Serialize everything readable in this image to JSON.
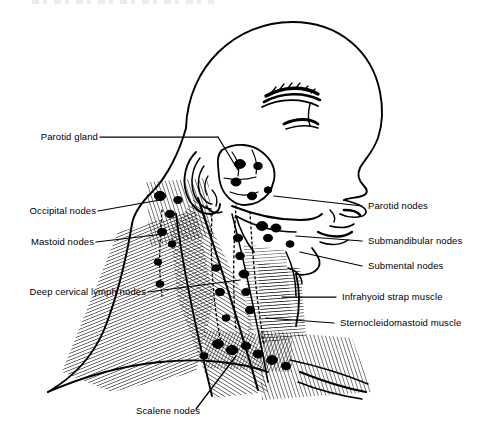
{
  "figure": {
    "type": "anatomical-line-drawing",
    "background_color": "#ffffff",
    "ink_color": "#000000",
    "style": "black-and-white pen-and-ink medical illustration with parallel-line muscle hatching"
  },
  "labels_left": [
    {
      "id": "parotid-gland",
      "text": "Parotid gland"
    },
    {
      "id": "occipital-nodes",
      "text": "Occipital nodes"
    },
    {
      "id": "mastoid-nodes",
      "text": "Mastoid nodes"
    },
    {
      "id": "deep-cervical-lymph-nodes",
      "text": "Deep cervical lymph nodes"
    }
  ],
  "labels_right": [
    {
      "id": "parotid-nodes",
      "text": "Parotid nodes"
    },
    {
      "id": "submandibular-nodes",
      "text": "Submandibular nodes"
    },
    {
      "id": "submental-nodes",
      "text": "Submental nodes"
    },
    {
      "id": "infrahyoid-strap-muscle",
      "text": "Infrahyoid strap muscle"
    },
    {
      "id": "sternocleidomastoid-muscle",
      "text": "Sternocleidomastoid muscle"
    }
  ],
  "labels_bottom": [
    {
      "id": "scalene-nodes",
      "text": "Scalene nodes"
    }
  ],
  "anatomy_features": [
    "bald cranium in profile",
    "eyebrow and closed eye",
    "nose and lips",
    "external ear (auricle)",
    "lobulated parotid gland with embedded nodes",
    "mandible / jawline",
    "sternocleidomastoid muscle band",
    "trapezius and shoulder slope",
    "clavicle",
    "dotted lymphatic chains with oval nodes"
  ]
}
